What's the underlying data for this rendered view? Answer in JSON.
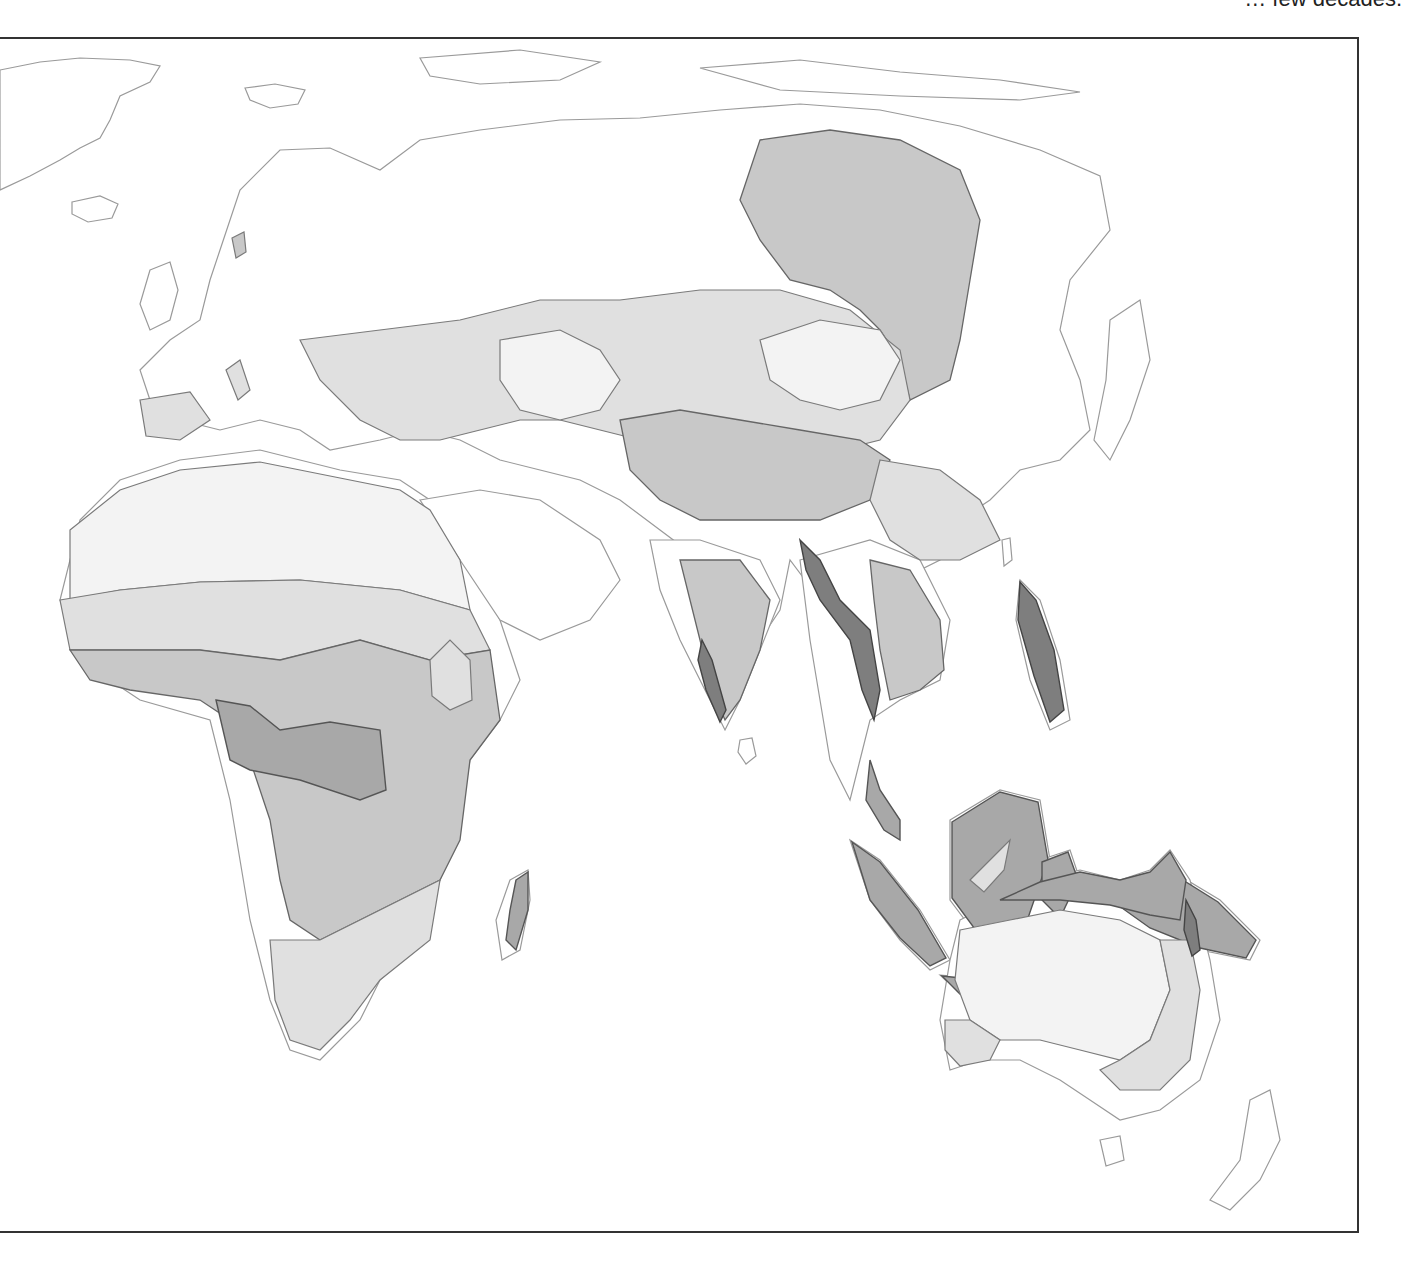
{
  "page": {
    "top_text_fragment": "decades.",
    "top_text_prefix": "… few"
  },
  "map": {
    "region": "Africa, Europe, Asia and Australia",
    "legend": [],
    "shading": {
      "lightest": "#f3f3f3",
      "light": "#e0e0e0",
      "medium": "#c8c8c8",
      "dark": "#a8a8a8",
      "darkest": "#7e7e7e",
      "outline": "#9a9a9a",
      "frame": "#333333"
    }
  }
}
